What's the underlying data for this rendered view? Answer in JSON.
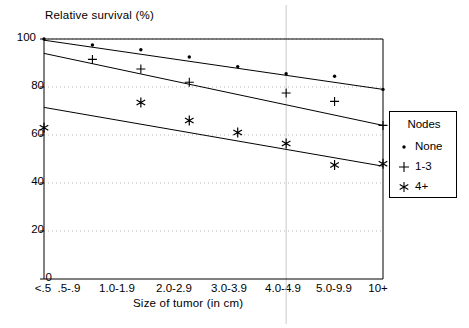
{
  "chart_data": {
    "type": "scatter",
    "title": "",
    "ylabel": "Relative survival  (%)",
    "xlabel": "Size of tumor (in cm)",
    "categories": [
      "<.5",
      ".5-.9",
      "1.0-1.9",
      "2.0-2.9",
      "3.0-3.9",
      "4.0-4.9",
      "5.0-9.9",
      "10+"
    ],
    "ylim": [
      0,
      100
    ],
    "yticks": [
      0,
      20,
      40,
      60,
      80,
      100
    ],
    "grid": true,
    "legend_position": "right",
    "legend_title": "Nodes",
    "series": [
      {
        "name": "None",
        "marker": "dot",
        "values": [
          100.0,
          97.5,
          95.5,
          92.5,
          88.5,
          85.5,
          84.5,
          79.0
        ],
        "fit_start": 99.5,
        "fit_end": 79.0
      },
      {
        "name": "1-3",
        "marker": "plus",
        "values": [
          null,
          91.5,
          87.5,
          82.0,
          null,
          77.5,
          74.0,
          64.0
        ],
        "fit_start": 94.0,
        "fit_end": 64.0
      },
      {
        "name": "4+",
        "marker": "asterisk",
        "values": [
          63.0,
          null,
          73.5,
          66.0,
          61.0,
          56.5,
          47.5,
          48.0
        ],
        "fit_start": 71.5,
        "fit_end": 47.0
      }
    ]
  },
  "legend": {
    "title": "Nodes",
    "items": [
      {
        "label": "None",
        "marker": "dot-marker"
      },
      {
        "label": "1-3",
        "marker": "plus-marker"
      },
      {
        "label": "4+",
        "marker": "asterisk-marker"
      }
    ]
  },
  "axes": {
    "y_title": "Relative survival  (%)",
    "x_title": "Size of tumor (in cm)",
    "y_ticks": [
      "0",
      "20",
      "40",
      "60",
      "80",
      "100"
    ],
    "x_ticks": [
      "<.5",
      ".5-.9",
      "1.0-1.9",
      "2.0-2.9",
      "3.0-3.9",
      "4.0-4.9",
      "5.0-9.9",
      "10+"
    ]
  },
  "style": {
    "axis_color": "#000000",
    "grid_color": "#b8b8b8",
    "marker_color": "#000000",
    "background": "#ffffff"
  }
}
